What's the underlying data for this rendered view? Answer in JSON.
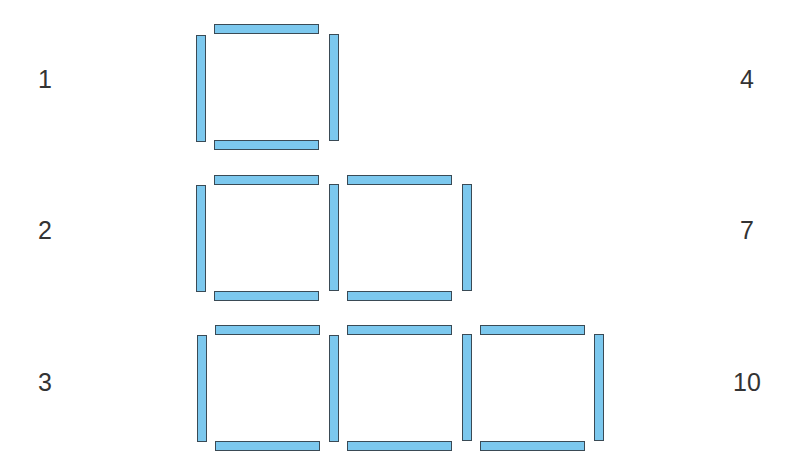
{
  "colors": {
    "stick_fill": "#7cc8ee",
    "stick_border": "#3a4a55",
    "text": "#333333"
  },
  "rows": [
    {
      "squares_label": "1",
      "sticks_label": "4"
    },
    {
      "squares_label": "2",
      "sticks_label": "7"
    },
    {
      "squares_label": "3",
      "sticks_label": "10"
    }
  ]
}
